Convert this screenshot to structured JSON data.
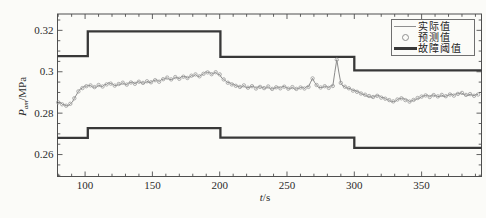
{
  "figure": {
    "background_color": "#fbfbf8",
    "style": "grayscale scanned paper figure"
  },
  "legend": {
    "items": [
      {
        "label": "实际值",
        "symbol": "thin-gray-line"
      },
      {
        "label": "预测值",
        "symbol": "open-circle-marker"
      },
      {
        "label": "故障阈值",
        "symbol": "thick-dark-line"
      }
    ]
  },
  "chart_data": {
    "type": "line",
    "title": "",
    "xlabel": "t/s",
    "xlabel_symbol": "t",
    "xlabel_unit": "/s",
    "ylabel": "Pam/MPa",
    "ylabel_symbol": "P",
    "ylabel_subscript": "am",
    "ylabel_unit": "/MPa",
    "xlim": [
      79.5,
      394.5
    ],
    "ylim": [
      0.2494,
      0.3279
    ],
    "x_ticks": [
      100,
      150,
      200,
      250,
      300,
      350
    ],
    "x_tick_labels": [
      "100",
      "150",
      "200",
      "250",
      "300",
      "350"
    ],
    "x_minor_tick_step": 10,
    "y_ticks": [
      0.26,
      0.28,
      0.3,
      0.32
    ],
    "y_tick_labels": [
      "0.26",
      "0.28",
      "0.3",
      "0.32"
    ],
    "y_minor_tick_step": 0.005,
    "grid": false,
    "ticks_on_all_sides": true,
    "legend_position": "top-right",
    "colors": {
      "actual_line": "#7e7e7e",
      "predicted_marker": "#9a9a9a",
      "threshold_line": "#383838",
      "axis": "#4f4f4f",
      "text": "#2b2b2b"
    },
    "noise_amplitude": 0.0006,
    "series": [
      {
        "name": "实际值",
        "kind": "line",
        "x_start": 80,
        "x_step": 3,
        "values": [
          0.2852,
          0.2843,
          0.2836,
          0.2845,
          0.2872,
          0.2905,
          0.2921,
          0.293,
          0.2934,
          0.2926,
          0.2936,
          0.2929,
          0.2939,
          0.2943,
          0.2933,
          0.2941,
          0.2947,
          0.2938,
          0.2948,
          0.2942,
          0.2952,
          0.2946,
          0.2954,
          0.2949,
          0.2959,
          0.2952,
          0.2964,
          0.2972,
          0.2963,
          0.2974,
          0.2966,
          0.2976,
          0.297,
          0.2981,
          0.2987,
          0.2978,
          0.299,
          0.2997,
          0.2988,
          0.2998,
          0.2987,
          0.2963,
          0.2947,
          0.2939,
          0.2932,
          0.2927,
          0.2934,
          0.2923,
          0.293,
          0.2919,
          0.2927,
          0.2921,
          0.2929,
          0.2917,
          0.2925,
          0.292,
          0.2928,
          0.2918,
          0.2926,
          0.2917,
          0.2924,
          0.2919,
          0.2927,
          0.2968,
          0.2936,
          0.2924,
          0.293,
          0.2922,
          0.2931,
          0.3058,
          0.2946,
          0.2928,
          0.292,
          0.2909,
          0.2903,
          0.2895,
          0.2889,
          0.2883,
          0.2878,
          0.2884,
          0.2875,
          0.287,
          0.2863,
          0.2857,
          0.2866,
          0.2872,
          0.2863,
          0.2856,
          0.2864,
          0.2873,
          0.288,
          0.2886,
          0.2878,
          0.2887,
          0.2881,
          0.2888,
          0.2882,
          0.289,
          0.2885,
          0.2893,
          0.2898,
          0.2888,
          0.2892,
          0.2884,
          0.289
        ]
      },
      {
        "name": "预测值",
        "kind": "scatter",
        "marker": "open-circle",
        "points": "coincide_with_actual_series"
      },
      {
        "name": "故障阈值",
        "kind": "step",
        "upper": {
          "x": [
            79.5,
            102,
            102,
            200.5,
            200.5,
            300,
            300,
            394.5
          ],
          "values": [
            0.3075,
            0.3075,
            0.3195,
            0.3195,
            0.3072,
            0.3072,
            0.3007,
            0.3007
          ]
        },
        "lower": {
          "x": [
            79.5,
            102,
            102,
            200.5,
            200.5,
            300,
            300,
            394.5
          ],
          "values": [
            0.2681,
            0.2681,
            0.2728,
            0.2728,
            0.2682,
            0.2682,
            0.2632,
            0.2632
          ]
        }
      }
    ]
  }
}
